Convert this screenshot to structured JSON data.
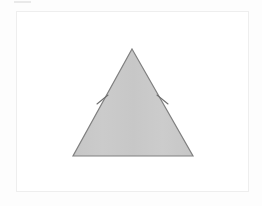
{
  "canvas": {
    "width": 262,
    "height": 206,
    "background_color": "#fdfdfd"
  },
  "top_fragment": {
    "label": "",
    "color": "#e9e9e9"
  },
  "figure_card": {
    "label": "",
    "background_color": "#ffffff",
    "border_color": "#eeeeee"
  },
  "diagram": {
    "title": "",
    "shape_name": "isosceles triangle",
    "fill_color": "#c9c9c9",
    "stroke_color": "#808080",
    "stroke_width": 1.2,
    "vertices": {
      "apex": {
        "x": 115,
        "y": 37
      },
      "bottom_left": {
        "x": 56,
        "y": 144
      },
      "bottom_right": {
        "x": 176,
        "y": 144
      }
    },
    "tick_marks": [
      {
        "name": "left-leg-congruence-tick",
        "x1": 80,
        "y1": 92,
        "x2": 91,
        "y2": 83,
        "color": "#707070"
      },
      {
        "name": "right-leg-congruence-tick",
        "x1": 140,
        "y1": 83,
        "x2": 151,
        "y2": 92,
        "color": "#707070"
      }
    ],
    "labels": []
  }
}
